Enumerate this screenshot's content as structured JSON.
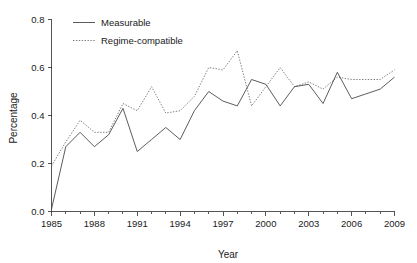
{
  "chart_data": {
    "type": "line",
    "title": "",
    "xlabel": "Year",
    "ylabel": "Percentage",
    "xlim": [
      1985,
      2009
    ],
    "ylim": [
      0.0,
      0.8
    ],
    "grid": false,
    "legend_position": "top-left",
    "x_tick_labels": [
      "1985",
      "1988",
      "1991",
      "1994",
      "1997",
      "2000",
      "2003",
      "2006",
      "2009"
    ],
    "x_ticks": [
      1985,
      1988,
      1991,
      1994,
      1997,
      2000,
      2003,
      2006,
      2009
    ],
    "x_minor_ticks": [
      1986,
      1987,
      1989,
      1990,
      1992,
      1993,
      1995,
      1996,
      1998,
      1999,
      2001,
      2002,
      2004,
      2005,
      2007,
      2008
    ],
    "y_tick_labels": [
      "0.0",
      "0.2",
      "0.4",
      "0.6",
      "0.8"
    ],
    "y_ticks": [
      0.0,
      0.2,
      0.4,
      0.6,
      0.8
    ],
    "x": [
      1985,
      1986,
      1987,
      1988,
      1989,
      1990,
      1991,
      1992,
      1993,
      1994,
      1995,
      1996,
      1997,
      1998,
      1999,
      2000,
      2001,
      2002,
      2003,
      2004,
      2005,
      2006,
      2007,
      2008,
      2009
    ],
    "series": [
      {
        "name": "Measurable",
        "style": "solid",
        "color": "#4a4a4a",
        "values": [
          0.01,
          0.27,
          0.33,
          0.27,
          0.32,
          0.43,
          0.25,
          0.3,
          0.35,
          0.3,
          0.42,
          0.5,
          0.46,
          0.44,
          0.55,
          0.53,
          0.44,
          0.52,
          0.53,
          0.45,
          0.58,
          0.47,
          0.49,
          0.51,
          0.56
        ]
      },
      {
        "name": "Regime-compatible",
        "style": "dotted",
        "color": "#6e6e6e",
        "values": [
          0.19,
          0.29,
          0.38,
          0.33,
          0.33,
          0.45,
          0.42,
          0.52,
          0.41,
          0.42,
          0.48,
          0.6,
          0.59,
          0.67,
          0.44,
          0.52,
          0.6,
          0.52,
          0.54,
          0.51,
          0.56,
          0.55,
          0.55,
          0.55,
          0.59
        ]
      }
    ]
  },
  "legend": {
    "entries": [
      {
        "label": "Measurable"
      },
      {
        "label": "Regime-compatible"
      }
    ]
  },
  "colors": {
    "axis": "#2b2b2b",
    "measurable": "#4a4a4a",
    "regime_compatible": "#6e6e6e",
    "background": "#ffffff"
  }
}
